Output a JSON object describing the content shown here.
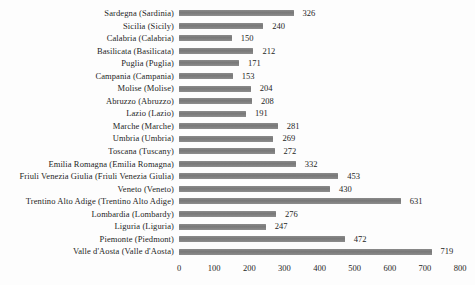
{
  "chart_data": {
    "type": "bar",
    "orientation": "horizontal",
    "title": "",
    "xlabel": "",
    "ylabel": "",
    "categories": [
      "Sardegna (Sardinia)",
      "Sicilia (Sicily)",
      "Calabria (Calabria)",
      "Basilicata (Basilicata)",
      "Puglia (Puglia)",
      "Campania (Campania)",
      "Molise (Molise)",
      "Abruzzo (Abruzzo)",
      "Lazio (Lazio)",
      "Marche (Marche)",
      "Umbria (Umbria)",
      "Toscana (Tuscany)",
      "Emilia Romagna (Emilia Romagna)",
      "Friuli Venezia Giulia (Friuli Venezia Giulia)",
      "Veneto (Veneto)",
      "Trentino Alto Adige (Trentino Alto Adige)",
      "Lombardia (Lombardy)",
      "Liguria (Liguria)",
      "Piemonte (Piedmont)",
      "Valle d'Aosta (Valle d'Aosta)"
    ],
    "values": [
      326,
      240,
      150,
      212,
      171,
      153,
      204,
      208,
      191,
      281,
      269,
      272,
      332,
      453,
      430,
      631,
      276,
      247,
      472,
      719
    ],
    "value_labels_shown": true,
    "xlim": [
      0,
      800
    ],
    "x_ticks": [
      0,
      100,
      200,
      300,
      400,
      500,
      600,
      700,
      800
    ],
    "grid": "off",
    "legend": "none",
    "bar_color": "#7f7f7f",
    "text_color": "#1e1e1e",
    "background_color": "#fdfdfd"
  },
  "layout": {
    "px_per_unit": 0.3513
  }
}
